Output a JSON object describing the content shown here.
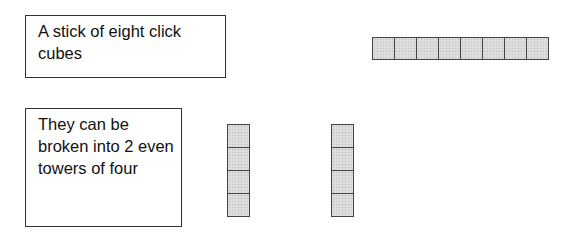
{
  "labels": {
    "stick": "A stick of eight click cubes",
    "towers": "They can be broken into 2 even towers of four"
  },
  "stick": {
    "cube_count": 8,
    "orientation": "horizontal"
  },
  "towers": [
    {
      "cube_count": 4,
      "orientation": "vertical"
    },
    {
      "cube_count": 4,
      "orientation": "vertical"
    }
  ],
  "colors": {
    "cube_fill": "#dddddd",
    "cube_border": "#444444",
    "box_border": "#333333"
  }
}
